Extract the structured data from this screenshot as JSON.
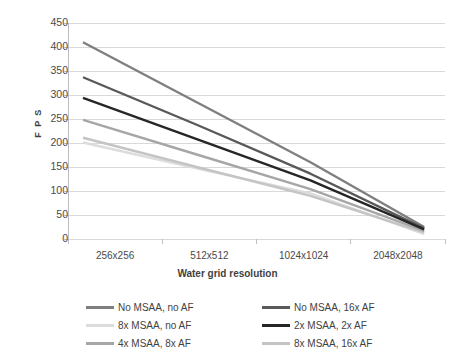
{
  "chart_data": {
    "type": "line",
    "title": "",
    "xlabel": "Water grid resolution",
    "ylabel": "F P S",
    "categories": [
      "256x256",
      "512x512",
      "1024x1024",
      "2048x2048"
    ],
    "ylim": [
      0,
      450
    ],
    "yticks": [
      0,
      50,
      100,
      150,
      200,
      250,
      300,
      350,
      400,
      450
    ],
    "grid": true,
    "legend_position": "bottom",
    "series": [
      {
        "name": "No MSAA, no AF",
        "values": [
          410,
          285,
          160,
          25
        ],
        "color": "#7f7f7f"
      },
      {
        "name": "No MSAA, 16x AF",
        "values": [
          337,
          238,
          136,
          22
        ],
        "color": "#595959"
      },
      {
        "name": "2x MSAA, 2x AF",
        "values": [
          294,
          208,
          122,
          20
        ],
        "color": "#262626"
      },
      {
        "name": "4x MSAA, 8x AF",
        "values": [
          248,
          176,
          104,
          17
        ],
        "color": "#a6a6a6"
      },
      {
        "name": "8x MSAA, 16x AF",
        "values": [
          211,
          150,
          90,
          14
        ],
        "color": "#c4c4c4"
      },
      {
        "name": "8x MSAA, no AF",
        "values": [
          201,
          147,
          95,
          10
        ],
        "color": "#dcdcdc"
      }
    ],
    "legend_layout": [
      {
        "name": "No MSAA, no AF",
        "color": "#7f7f7f",
        "col": 0,
        "row": 0
      },
      {
        "name": "8x MSAA, no AF",
        "color": "#dcdcdc",
        "col": 0,
        "row": 1
      },
      {
        "name": "4x MSAA, 8x AF",
        "color": "#a6a6a6",
        "col": 0,
        "row": 2
      },
      {
        "name": "No MSAA, 16x AF",
        "color": "#595959",
        "col": 1,
        "row": 0
      },
      {
        "name": "2x MSAA, 2x AF",
        "color": "#262626",
        "col": 1,
        "row": 1
      },
      {
        "name": "8x MSAA, 16x AF",
        "color": "#c4c4c4",
        "col": 1,
        "row": 2
      }
    ],
    "colors": {
      "grid": "#d9d9d9",
      "axis": "#bfbfbf",
      "text": "#4a4a4a",
      "background": "#ffffff"
    }
  }
}
